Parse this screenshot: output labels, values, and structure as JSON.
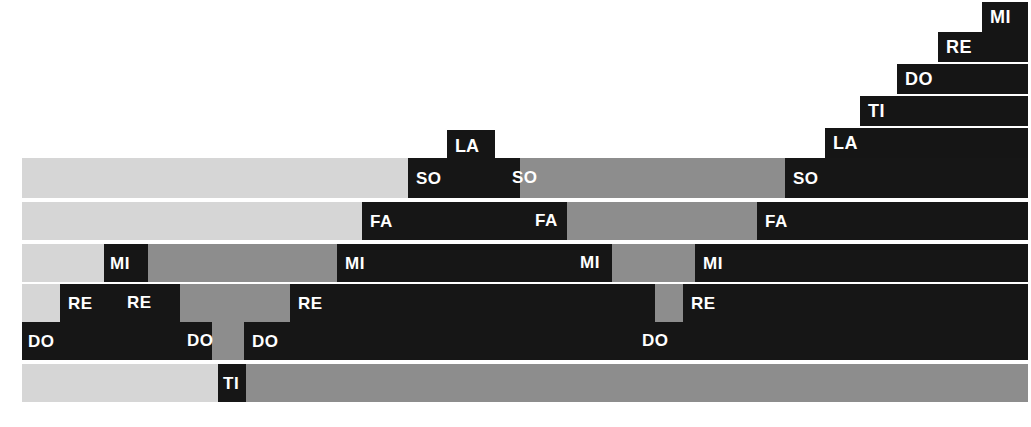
{
  "figure": {
    "type": "stacked-horizontal-bar",
    "palette": {
      "light": "#d6d6d6",
      "mid": "#8d8d8d",
      "dark": "#161616",
      "background": "#ffffff",
      "label_on_dark": "#ffffff",
      "label_on_light": "#111111"
    }
  },
  "margin_glyphs": [
    {
      "text": "o",
      "top": 12
    },
    {
      "text": "n",
      "top": 62
    },
    {
      "text": "-",
      "top": 112
    },
    {
      "text": "n",
      "top": 152
    },
    {
      "text": "l",
      "top": 268
    },
    {
      "text": "t",
      "top": 312
    }
  ],
  "staircase": {
    "note": "Ascending black step bars anchored at the right edge",
    "steps": [
      {
        "label": "LA",
        "x": 825,
        "y": 128,
        "w": 203,
        "h": 30
      },
      {
        "label": "TI",
        "x": 860,
        "y": 96,
        "w": 168,
        "h": 30
      },
      {
        "label": "DO",
        "x": 897,
        "y": 64,
        "w": 131,
        "h": 30
      },
      {
        "label": "RE",
        "x": 938,
        "y": 32,
        "w": 90,
        "h": 30
      },
      {
        "label": "MI",
        "x": 982,
        "y": 2,
        "w": 46,
        "h": 30
      }
    ]
  },
  "riser": {
    "label": "LA",
    "x": 447,
    "y": 130,
    "w": 48,
    "h": 30
  },
  "rows": [
    {
      "name": "SO",
      "y": 158,
      "h": 40,
      "segments": [
        {
          "tone": "light",
          "width": 386,
          "label": ""
        },
        {
          "tone": "dark",
          "width": 112,
          "label": "SO",
          "label_x": 8
        },
        {
          "tone": "dark",
          "width": 0,
          "label": ""
        },
        {
          "tone": "mid",
          "width": 265,
          "label": ""
        },
        {
          "tone": "dark",
          "width": 243,
          "label": "SO",
          "label_x": 8
        }
      ],
      "extra_labels": [
        {
          "text": "SO",
          "x": 490
        }
      ]
    },
    {
      "name": "FA",
      "y": 202,
      "h": 38,
      "segments": [
        {
          "tone": "light",
          "width": 340,
          "label": ""
        },
        {
          "tone": "dark",
          "width": 205,
          "label": "FA",
          "label_x": 8
        },
        {
          "tone": "mid",
          "width": 190,
          "label": ""
        },
        {
          "tone": "dark",
          "width": 271,
          "label": "FA",
          "label_x": 8
        }
      ],
      "extra_labels": [
        {
          "text": "FA",
          "x": 513
        }
      ]
    },
    {
      "name": "MI",
      "y": 244,
      "h": 38,
      "segments": [
        {
          "tone": "light",
          "width": 82,
          "label": ""
        },
        {
          "tone": "dark",
          "width": 44,
          "label": "MI",
          "label_x": 6
        },
        {
          "tone": "mid",
          "width": 189,
          "label": ""
        },
        {
          "tone": "dark",
          "width": 275,
          "label": "MI",
          "label_x": 8
        },
        {
          "tone": "mid",
          "width": 83,
          "label": ""
        },
        {
          "tone": "dark",
          "width": 333,
          "label": "MI",
          "label_x": 8
        }
      ],
      "extra_labels": [
        {
          "text": "MI",
          "x": 558
        }
      ]
    },
    {
      "name": "RE",
      "y": 284,
      "h": 38,
      "segments": [
        {
          "tone": "light",
          "width": 38,
          "label": ""
        },
        {
          "tone": "dark",
          "width": 120,
          "label": "RE",
          "label_x": 8
        },
        {
          "tone": "mid",
          "width": 110,
          "label": ""
        },
        {
          "tone": "dark",
          "width": 365,
          "label": "RE",
          "label_x": 8
        },
        {
          "tone": "mid",
          "width": 28,
          "label": ""
        },
        {
          "tone": "dark",
          "width": 345,
          "label": "RE",
          "label_x": 8
        }
      ],
      "extra_labels": [
        {
          "text": "RE",
          "x": 105
        }
      ]
    },
    {
      "name": "DO",
      "y": 322,
      "h": 38,
      "segments": [
        {
          "tone": "dark",
          "width": 190,
          "label": "DO",
          "label_x": 6
        },
        {
          "tone": "mid",
          "width": 32,
          "label": ""
        },
        {
          "tone": "dark",
          "width": 784,
          "label": "DO",
          "label_x": 8
        }
      ],
      "extra_labels": [
        {
          "text": "DO",
          "x": 165
        },
        {
          "text": "DO",
          "x": 620
        }
      ]
    },
    {
      "name": "TI",
      "y": 364,
      "h": 38,
      "segments": [
        {
          "tone": "light",
          "width": 196,
          "label": ""
        },
        {
          "tone": "dark",
          "width": 28,
          "label": "TI",
          "label_x": 5
        },
        {
          "tone": "mid",
          "width": 782,
          "label": ""
        }
      ],
      "extra_labels": []
    }
  ],
  "chart_data": {
    "type": "bar",
    "title": "",
    "xlabel": "",
    "ylabel": "",
    "orientation": "horizontal",
    "categories": [
      "SO",
      "FA",
      "MI",
      "RE",
      "DO",
      "TI"
    ],
    "note": "Each row is a full-width stacked bar partitioned into light, medium and dark grey intervals; labels repeat the row's solfege syllable at each dark interval.",
    "rows": [
      {
        "name": "SO",
        "segment_widths": [
          386,
          112,
          265,
          243
        ],
        "segment_tones": [
          "light",
          "dark",
          "mid",
          "dark"
        ],
        "label_count": 3
      },
      {
        "name": "FA",
        "segment_widths": [
          340,
          205,
          190,
          271
        ],
        "segment_tones": [
          "light",
          "dark",
          "mid",
          "dark"
        ],
        "label_count": 3
      },
      {
        "name": "MI",
        "segment_widths": [
          82,
          44,
          189,
          275,
          83,
          333
        ],
        "segment_tones": [
          "light",
          "dark",
          "mid",
          "dark",
          "mid",
          "dark"
        ],
        "label_count": 4
      },
      {
        "name": "RE",
        "segment_widths": [
          38,
          120,
          110,
          365,
          28,
          345
        ],
        "segment_tones": [
          "light",
          "dark",
          "mid",
          "dark",
          "mid",
          "dark"
        ],
        "label_count": 5
      },
      {
        "name": "DO",
        "segment_widths": [
          190,
          32,
          784
        ],
        "segment_tones": [
          "dark",
          "mid",
          "dark"
        ],
        "label_count": 4
      },
      {
        "name": "TI",
        "segment_widths": [
          196,
          28,
          782
        ],
        "segment_tones": [
          "light",
          "dark",
          "mid"
        ],
        "label_count": 1
      }
    ],
    "staircase_labels": [
      "LA",
      "TI",
      "DO",
      "RE",
      "MI"
    ],
    "total_width": 1006,
    "legend": [],
    "grid": false
  }
}
